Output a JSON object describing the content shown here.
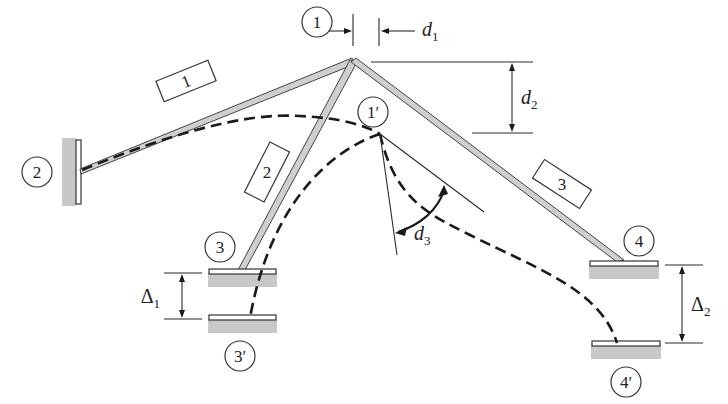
{
  "figure": {
    "colors": {
      "member_fill": "#cfcfcf",
      "line": "#222222",
      "ground": "#c8c8c8",
      "background": "#ffffff"
    },
    "nodes": [
      {
        "id": "1",
        "label": "1",
        "x": 318,
        "y": 22
      },
      {
        "id": "2",
        "label": "2",
        "x": 37,
        "y": 112
      },
      {
        "id": "3",
        "label": "3",
        "x": 220,
        "y": 243
      },
      {
        "id": "4",
        "label": "4",
        "x": 636,
        "y": 241
      },
      {
        "id": "1p",
        "label": "1′",
        "x": 382,
        "y": 115
      },
      {
        "id": "3p",
        "label": "3′",
        "x": 240,
        "y": 354
      },
      {
        "id": "4p",
        "label": "4′",
        "x": 623,
        "y": 376
      }
    ],
    "members": [
      {
        "id": "m1",
        "label": "1",
        "x": 193,
        "y": 82
      },
      {
        "id": "m2",
        "label": "2",
        "x": 265,
        "y": 172
      },
      {
        "id": "m3",
        "label": "3",
        "x": 560,
        "y": 187
      }
    ],
    "dimensions": {
      "d1": "d",
      "d1_sub": "1",
      "d2": "d",
      "d2_sub": "2",
      "d3": "d",
      "d3_sub": "3",
      "delta1": "Δ",
      "delta1_sub": "1",
      "delta2": "Δ",
      "delta2_sub": "2"
    }
  }
}
